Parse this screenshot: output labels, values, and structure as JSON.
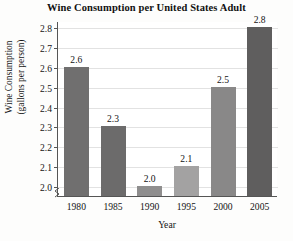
{
  "chart_data": {
    "type": "bar",
    "title": "Wine Consumption per United States Adult",
    "xlabel": "Year",
    "ylabel": "Wine Consumption",
    "ylabel_line2": "(gallons per person)",
    "categories": [
      "1980",
      "1985",
      "1990",
      "1995",
      "2000",
      "2005"
    ],
    "values": [
      2.6,
      2.3,
      2.0,
      2.1,
      2.5,
      2.8
    ],
    "value_labels": [
      "2.6",
      "2.3",
      "2.0",
      "2.1",
      "2.5",
      "2.8"
    ],
    "bar_colors": [
      "#706f6f",
      "#6c6b6b",
      "#8f8e8e",
      "#a3a2a2",
      "#898888",
      "#5f5e5e"
    ],
    "ylim": [
      1.95,
      2.83
    ],
    "ytick_values": [
      2.0,
      2.1,
      2.2,
      2.3,
      2.4,
      2.5,
      2.6,
      2.7,
      2.8
    ],
    "ytick_labels": [
      "2.0",
      "2.1",
      "2.2",
      "2.3",
      "2.4",
      "2.5",
      "2.6",
      "2.7",
      "2.8"
    ],
    "grid": true,
    "grid_axis": "y",
    "legend": "none",
    "axis_break": true,
    "axis_color": "#555555",
    "grid_color": "#e2e2e2",
    "background": "#ffffff"
  }
}
